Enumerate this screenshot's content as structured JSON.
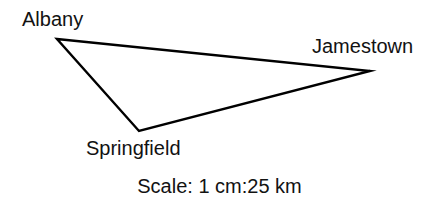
{
  "figure": {
    "type": "scale-drawing-triangle",
    "background_color": "#ffffff",
    "stroke_color": "#000000",
    "text_color": "#121212"
  },
  "labels": {
    "albany": "Albany",
    "jamestown": "Jamestown",
    "springfield": "Springfield"
  },
  "caption": {
    "scale_text": "Scale: 1 cm:25 km"
  },
  "chart_data": {
    "type": "scatter",
    "title": "",
    "subtitle": "",
    "xlabel": "",
    "ylabel": "",
    "annotations": [
      "Scale: 1 cm:25 km"
    ],
    "legend": [],
    "grid": false,
    "vertices": [
      {
        "name": "Albany",
        "x": 57,
        "y": 39
      },
      {
        "name": "Jamestown",
        "x": 370,
        "y": 71
      },
      {
        "name": "Springfield",
        "x": 139,
        "y": 131
      }
    ],
    "edges": [
      {
        "from": "Albany",
        "to": "Jamestown"
      },
      {
        "from": "Jamestown",
        "to": "Springfield"
      },
      {
        "from": "Springfield",
        "to": "Albany"
      }
    ],
    "scale": {
      "map_value": 1,
      "map_unit": "cm",
      "real_value": 25,
      "real_unit": "km"
    }
  }
}
